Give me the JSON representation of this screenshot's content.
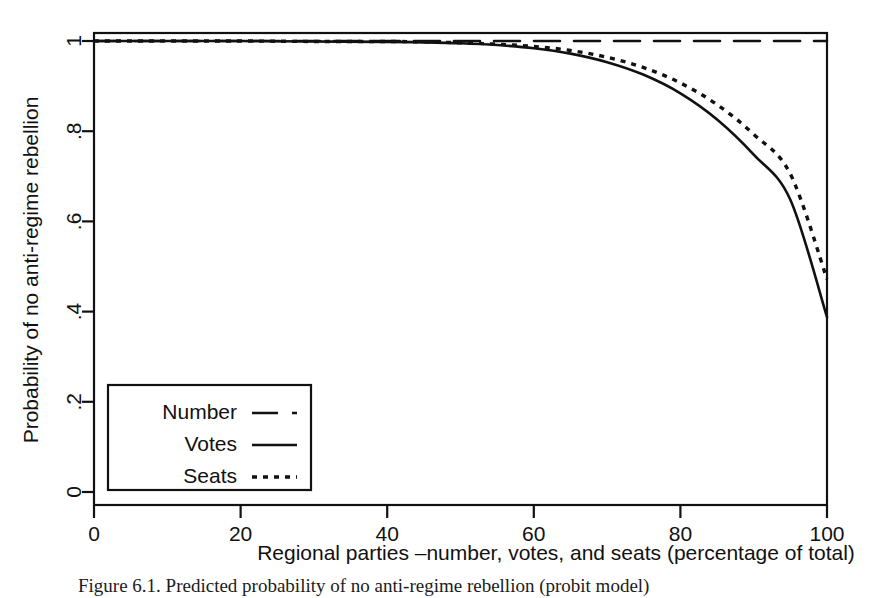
{
  "figure": {
    "caption": "Figure 6.1. Predicted probability of no anti-regime rebellion (probit model)"
  },
  "chart_data": {
    "type": "line",
    "title": "",
    "xlabel": "Regional parties –number, votes, and seats (percentage of total)",
    "ylabel": "Probability of no anti-regime rebellion",
    "xlim": [
      0,
      100
    ],
    "ylim": [
      0,
      1
    ],
    "xticks": [
      0,
      20,
      40,
      60,
      80,
      100
    ],
    "xtick_labels": [
      "0",
      "20",
      "40",
      "60",
      "80",
      "100"
    ],
    "yticks": [
      0,
      0.2,
      0.4,
      0.6,
      0.8,
      1
    ],
    "ytick_labels": [
      "0",
      ".2",
      ".4",
      ".6",
      ".8",
      "1"
    ],
    "grid": false,
    "legend_position": "lower-left",
    "series": [
      {
        "name": "Number",
        "style": "long-dash",
        "x": [
          0,
          10,
          20,
          30,
          40,
          50,
          60,
          70,
          80,
          90,
          100
        ],
        "values": [
          1.0,
          1.0,
          1.0,
          1.0,
          1.0,
          1.0,
          1.0,
          1.0,
          1.0,
          1.0,
          1.0
        ]
      },
      {
        "name": "Votes",
        "style": "solid",
        "x": [
          0,
          10,
          20,
          30,
          40,
          45,
          50,
          55,
          60,
          65,
          70,
          75,
          80,
          85,
          90,
          95,
          100
        ],
        "values": [
          1.0,
          1.0,
          1.0,
          0.999,
          0.998,
          0.997,
          0.995,
          0.991,
          0.984,
          0.972,
          0.953,
          0.925,
          0.884,
          0.826,
          0.748,
          0.648,
          0.388
        ]
      },
      {
        "name": "Seats",
        "style": "dotted",
        "x": [
          0,
          10,
          20,
          30,
          40,
          45,
          50,
          55,
          60,
          65,
          70,
          75,
          80,
          85,
          90,
          95,
          100
        ],
        "values": [
          1.0,
          1.0,
          1.0,
          0.999,
          0.999,
          0.998,
          0.996,
          0.993,
          0.988,
          0.979,
          0.964,
          0.941,
          0.907,
          0.859,
          0.793,
          0.705,
          0.472
        ]
      }
    ]
  },
  "legend": {
    "items": [
      {
        "label": "Number",
        "style": "long-dash"
      },
      {
        "label": "Votes",
        "style": "solid"
      },
      {
        "label": "Seats",
        "style": "dotted"
      }
    ]
  }
}
